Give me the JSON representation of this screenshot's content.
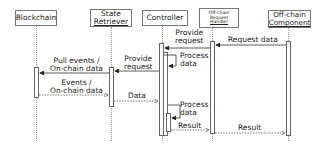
{
  "diagram": {
    "type": "sequence-diagram",
    "participants": [
      {
        "id": "blockchain",
        "label_lines": [
          "Blockchain"
        ]
      },
      {
        "id": "state_retriever",
        "label_lines": [
          "State",
          "Retriever"
        ]
      },
      {
        "id": "controller",
        "label_lines": [
          "Controller"
        ]
      },
      {
        "id": "request_handler",
        "label_lines": [
          "Off-chain",
          "Request",
          "Handler"
        ]
      },
      {
        "id": "offchain_component",
        "label_lines": [
          "Off-chain",
          "Component"
        ]
      }
    ],
    "messages": [
      {
        "from": "offchain_component",
        "to": "request_handler",
        "label_lines": [
          "Request data"
        ],
        "style": "solid"
      },
      {
        "from": "request_handler",
        "to": "controller",
        "label_lines": [
          "Provide",
          "request"
        ],
        "style": "solid"
      },
      {
        "from": "controller",
        "to": "controller",
        "label_lines": [
          "Process",
          "data"
        ],
        "style": "self"
      },
      {
        "from": "controller",
        "to": "state_retriever",
        "label_lines": [
          "Provide",
          "request"
        ],
        "style": "solid"
      },
      {
        "from": "state_retriever",
        "to": "blockchain",
        "label_lines": [
          "Pull events /",
          "On-chain data"
        ],
        "style": "solid"
      },
      {
        "from": "blockchain",
        "to": "state_retriever",
        "label_lines": [
          "Events /",
          "On-chain data"
        ],
        "style": "dashed-return"
      },
      {
        "from": "state_retriever",
        "to": "controller",
        "label_lines": [
          "Data"
        ],
        "style": "dashed-return"
      },
      {
        "from": "controller",
        "to": "controller",
        "label_lines": [
          "Process",
          "data"
        ],
        "style": "self"
      },
      {
        "from": "controller",
        "to": "request_handler",
        "label_lines": [
          "Result"
        ],
        "style": "dashed-return"
      },
      {
        "from": "request_handler",
        "to": "offchain_component",
        "label_lines": [
          "Result"
        ],
        "style": "dashed-return"
      }
    ]
  },
  "colors": {
    "line": "#333333",
    "lifeline": "#999999",
    "box_border": "#777777"
  }
}
